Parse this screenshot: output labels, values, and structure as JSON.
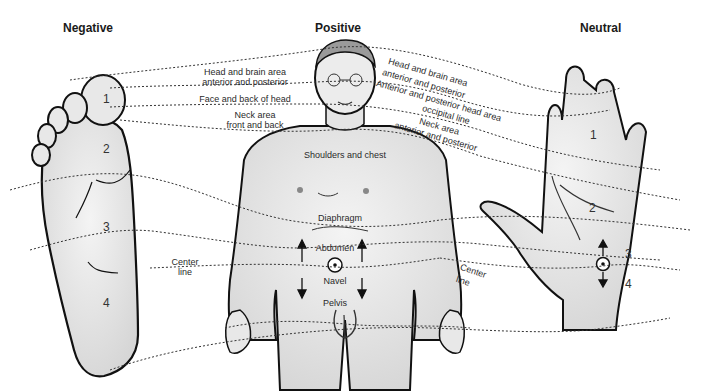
{
  "titles": {
    "negative": "Negative",
    "positive": "Positive",
    "neutral": "Neutral"
  },
  "left_labels": {
    "head_brain_1": "Head and brain area",
    "head_brain_2": "anterior and posterior",
    "face": "Face and back of head",
    "neck_1": "Neck area",
    "neck_2": "front and back",
    "center_1": "Center",
    "center_2": "line"
  },
  "right_labels": {
    "head_brain_1": "Head and brain area",
    "head_brain_2": "anterior and posterior",
    "anterior_head": "Anterior and posterior head area",
    "occipital": "occipital line",
    "neck_1": "Neck area",
    "neck_2": "anterior and posterior",
    "center_1": "Center",
    "center_2": "line"
  },
  "body_labels": {
    "shoulders": "Shoulders and chest",
    "diaphragm": "Diaphragm",
    "abdomen": "Abdomen",
    "navel": "Navel",
    "pelvis": "Pelvis"
  },
  "foot_zones": [
    "1",
    "2",
    "3",
    "4"
  ],
  "hand_zones": [
    "1",
    "2",
    "3",
    "4"
  ],
  "colors": {
    "outline": "#111111",
    "fill": "#e6e6e6",
    "dotted": "#333333"
  }
}
